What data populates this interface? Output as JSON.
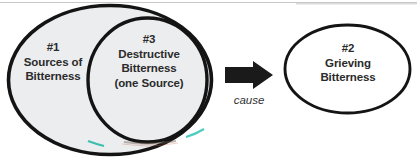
{
  "diagram": {
    "type": "venn-diagram",
    "background_color": "#ffffff",
    "sets": [
      {
        "id": "set-1",
        "number": "#1",
        "name_line_1": "Sources of",
        "name_line_2": "Bitterness",
        "fill_color": "#ecedef",
        "stroke_color": "#141414"
      },
      {
        "id": "set-3",
        "number": "#3",
        "name_line_1": "Destructive",
        "name_line_2": "Bitterness",
        "name_line_3": "(one Source)",
        "fill_color": "#ecedef",
        "stroke_color": "#141414"
      },
      {
        "id": "set-2",
        "number": "#2",
        "name_line_1": "Grieving",
        "name_line_2": "Bitterness",
        "fill_color": "#ffffff",
        "stroke_color": "#141414"
      }
    ],
    "connector": {
      "icon": "right-block-arrow-icon",
      "caption": "cause",
      "color": "#1a1a1a"
    }
  }
}
